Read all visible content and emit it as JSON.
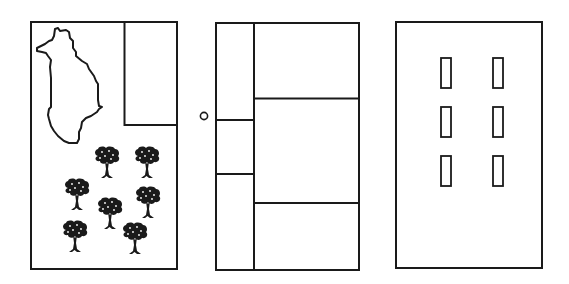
{
  "canvas": {
    "width": 569,
    "height": 284,
    "background": "#ffffff",
    "stroke": "#1a1a1a"
  },
  "panels": [
    {
      "name": "panel-1-map-and-trees",
      "frame": {
        "x": 31,
        "y": 22,
        "w": 146,
        "h": 247
      },
      "inset_rect": {
        "x": 124.5,
        "y": 22,
        "w": 52.5,
        "h": 103
      },
      "map_outline_icon": "island-outline-icon",
      "trees": [
        {
          "x": 94,
          "y": 146
        },
        {
          "x": 134,
          "y": 146
        },
        {
          "x": 64,
          "y": 178
        },
        {
          "x": 97,
          "y": 197
        },
        {
          "x": 135,
          "y": 186
        },
        {
          "x": 62,
          "y": 219
        },
        {
          "x": 122,
          "y": 222
        }
      ]
    },
    {
      "name": "panel-2-grid",
      "frame": {
        "x": 216,
        "y": 23,
        "w": 143,
        "h": 247
      },
      "vertical_divider_x": 254,
      "left_column_dividers_y": [
        120,
        174
      ],
      "right_column_dividers_y": [
        98.5,
        203
      ],
      "marker_circle": {
        "cx": 204,
        "cy": 116,
        "r": 3.6
      }
    },
    {
      "name": "panel-3-slots",
      "frame": {
        "x": 396,
        "y": 22,
        "w": 146,
        "h": 246
      },
      "slots": [
        {
          "x": 441,
          "y": 58,
          "w": 10,
          "h": 30
        },
        {
          "x": 493,
          "y": 58,
          "w": 10,
          "h": 30
        },
        {
          "x": 441,
          "y": 107,
          "w": 10,
          "h": 30
        },
        {
          "x": 493,
          "y": 107,
          "w": 10,
          "h": 30
        },
        {
          "x": 441,
          "y": 156,
          "w": 10,
          "h": 30
        },
        {
          "x": 493,
          "y": 156,
          "w": 10,
          "h": 30
        }
      ]
    }
  ]
}
